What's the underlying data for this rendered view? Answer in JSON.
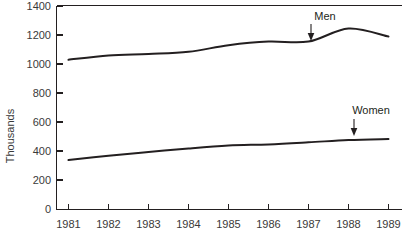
{
  "chart_data": {
    "type": "line",
    "title": "",
    "xlabel": "",
    "ylabel": "Thousands",
    "x": [
      1981,
      1982,
      1983,
      1984,
      1985,
      1986,
      1987,
      1988,
      1989
    ],
    "xtick_labels": [
      "1981",
      "1982",
      "1983",
      "1984",
      "1985",
      "1986",
      "1987",
      "1988",
      "1989"
    ],
    "ytick_labels": [
      "0",
      "200",
      "400",
      "600",
      "800",
      "1000",
      "1200",
      "1400"
    ],
    "ytick_values": [
      0,
      200,
      400,
      600,
      800,
      1000,
      1200,
      1400
    ],
    "ylim": [
      0,
      1400
    ],
    "xlim": [
      1981,
      1989
    ],
    "grid": false,
    "legend": "annotations",
    "series": [
      {
        "name": "Men",
        "values": [
          1030,
          1060,
          1070,
          1085,
          1130,
          1155,
          1155,
          1245,
          1190
        ],
        "annotation": {
          "label": "Men",
          "points_to_x": 1987.3,
          "points_to_y": 1160
        }
      },
      {
        "name": "Women",
        "values": [
          340,
          370,
          395,
          420,
          440,
          448,
          462,
          478,
          485
        ],
        "annotation": {
          "label": "Women",
          "points_to_x": 1988.3,
          "points_to_y": 478
        }
      }
    ]
  },
  "axis": {
    "y_title": "Thousands",
    "y_ticks": [
      {
        "label": "1400",
        "value": 1400
      },
      {
        "label": "1200",
        "value": 1200
      },
      {
        "label": "1000",
        "value": 1000
      },
      {
        "label": "800",
        "value": 800
      },
      {
        "label": "600",
        "value": 600
      },
      {
        "label": "400",
        "value": 400
      },
      {
        "label": "200",
        "value": 200
      },
      {
        "label": "0",
        "value": 0
      }
    ],
    "x_ticks": [
      {
        "label": "1981",
        "value": 1981
      },
      {
        "label": "1982",
        "value": 1982
      },
      {
        "label": "1983",
        "value": 1983
      },
      {
        "label": "1984",
        "value": 1984
      },
      {
        "label": "1985",
        "value": 1985
      },
      {
        "label": "1986",
        "value": 1986
      },
      {
        "label": "1987",
        "value": 1987
      },
      {
        "label": "1988",
        "value": 1988
      },
      {
        "label": "1989",
        "value": 1989
      }
    ]
  },
  "annotations": {
    "men_label": "Men",
    "women_label": "Women"
  },
  "colors": {
    "line": "#231f20",
    "axis": "#231f20",
    "text": "#3a3a3a",
    "background": "#ffffff"
  }
}
